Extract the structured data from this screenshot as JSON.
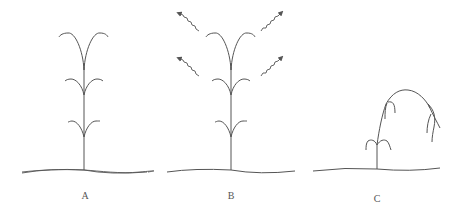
{
  "diagram": {
    "panels": [
      {
        "id": "A",
        "label": "A",
        "description": "Upright plant with three pairs of arching leaves"
      },
      {
        "id": "B",
        "label": "B",
        "description": "Upright plant with arrows radiating outward from upper leaves"
      },
      {
        "id": "C",
        "label": "C",
        "description": "Plant bending over with drooping leaves"
      }
    ],
    "colors": {
      "stroke": "#555555",
      "background": "#ffffff"
    }
  }
}
